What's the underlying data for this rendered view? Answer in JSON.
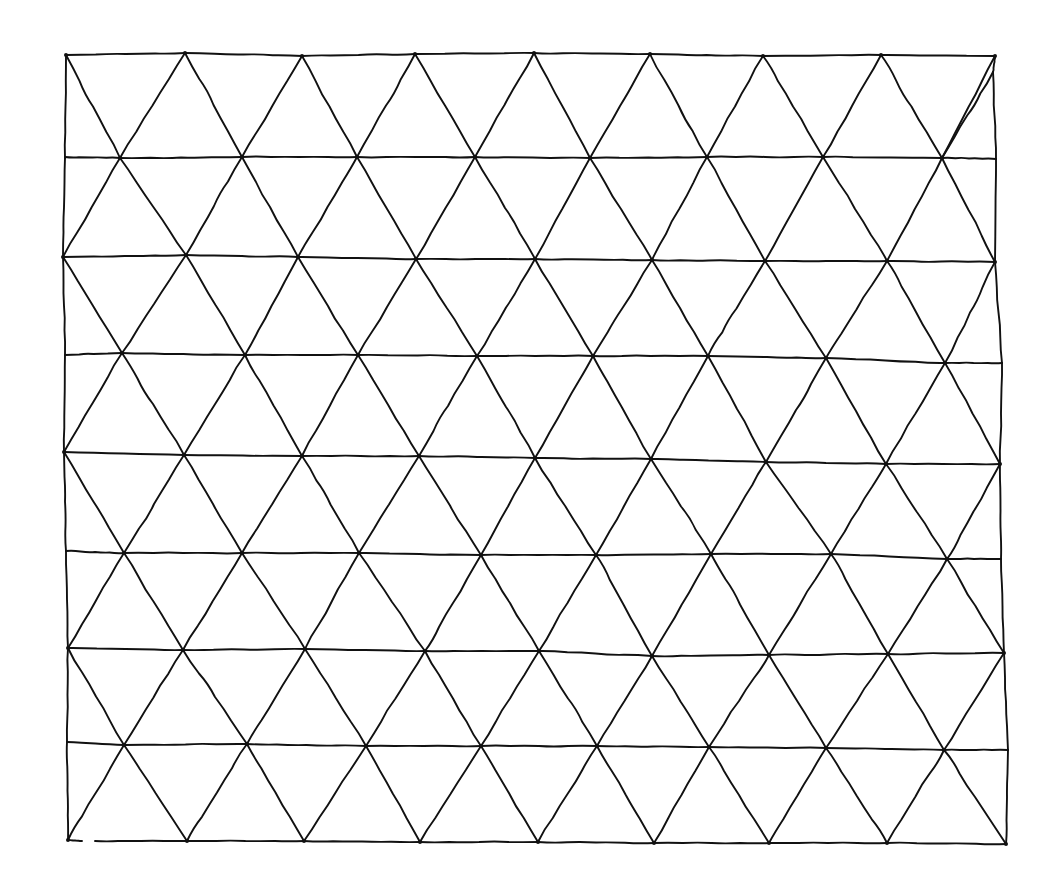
{
  "figure": {
    "stroke_color": "#111111",
    "background_color": "#ffffff"
  },
  "grid": {
    "rows": [
      {
        "y": 55,
        "vertices": [
          [
            66,
            55
          ],
          [
            185,
            53
          ],
          [
            302,
            56
          ],
          [
            415,
            54
          ],
          [
            534,
            53
          ],
          [
            650,
            54
          ],
          [
            763,
            56
          ],
          [
            881,
            55
          ],
          [
            995,
            56
          ]
        ]
      },
      {
        "y": 158,
        "vertices": [
          [
            65,
            157
          ],
          [
            120,
            158
          ],
          [
            242,
            157
          ],
          [
            357,
            157
          ],
          [
            475,
            157
          ],
          [
            590,
            158
          ],
          [
            707,
            157
          ],
          [
            823,
            157
          ],
          [
            942,
            158
          ],
          [
            996,
            159
          ]
        ]
      },
      {
        "y": 256,
        "vertices": [
          [
            63,
            257
          ],
          [
            186,
            255
          ],
          [
            298,
            257
          ],
          [
            416,
            259
          ],
          [
            535,
            259
          ],
          [
            652,
            260
          ],
          [
            765,
            261
          ],
          [
            887,
            261
          ],
          [
            995,
            262
          ]
        ]
      },
      {
        "y": 355,
        "vertices": [
          [
            65,
            355
          ],
          [
            122,
            353
          ],
          [
            245,
            355
          ],
          [
            358,
            355
          ],
          [
            477,
            356
          ],
          [
            593,
            356
          ],
          [
            708,
            356
          ],
          [
            826,
            358
          ],
          [
            945,
            363
          ],
          [
            1002,
            363
          ]
        ]
      },
      {
        "y": 453,
        "vertices": [
          [
            64,
            452
          ],
          [
            184,
            455
          ],
          [
            302,
            456
          ],
          [
            419,
            456
          ],
          [
            535,
            458
          ],
          [
            651,
            459
          ],
          [
            766,
            462
          ],
          [
            886,
            464
          ],
          [
            1000,
            464
          ]
        ]
      },
      {
        "y": 553,
        "vertices": [
          [
            66,
            551
          ],
          [
            124,
            553
          ],
          [
            242,
            553
          ],
          [
            359,
            553
          ],
          [
            481,
            555
          ],
          [
            596,
            555
          ],
          [
            711,
            554
          ],
          [
            831,
            554
          ],
          [
            947,
            559
          ],
          [
            1001,
            559
          ]
        ]
      },
      {
        "y": 650,
        "vertices": [
          [
            68,
            648
          ],
          [
            183,
            650
          ],
          [
            305,
            649
          ],
          [
            425,
            651
          ],
          [
            539,
            651
          ],
          [
            652,
            656
          ],
          [
            769,
            655
          ],
          [
            888,
            654
          ],
          [
            1004,
            653
          ]
        ]
      },
      {
        "y": 746,
        "vertices": [
          [
            67,
            742
          ],
          [
            124,
            745
          ],
          [
            247,
            744
          ],
          [
            366,
            746
          ],
          [
            481,
            746
          ],
          [
            597,
            746
          ],
          [
            709,
            747
          ],
          [
            826,
            748
          ],
          [
            944,
            750
          ],
          [
            1008,
            750
          ]
        ]
      },
      {
        "y": 843,
        "vertices": [
          [
            68,
            840
          ],
          [
            187,
            841
          ],
          [
            304,
            841
          ],
          [
            420,
            842
          ],
          [
            538,
            842
          ],
          [
            654,
            843
          ],
          [
            769,
            843
          ],
          [
            887,
            843
          ],
          [
            1006,
            844
          ]
        ]
      }
    ],
    "border": {
      "left": [
        [
          66,
          55
        ],
        [
          65,
          158
        ],
        [
          63,
          257
        ],
        [
          65,
          355
        ],
        [
          64,
          452
        ],
        [
          66,
          551
        ],
        [
          68,
          648
        ],
        [
          67,
          742
        ],
        [
          68,
          840
        ]
      ],
      "right": [
        [
          995,
          56
        ],
        [
          993,
          72
        ],
        [
          996,
          159
        ],
        [
          995,
          262
        ],
        [
          1002,
          363
        ],
        [
          1000,
          464
        ],
        [
          1001,
          559
        ],
        [
          1004,
          653
        ],
        [
          1008,
          750
        ],
        [
          1006,
          844
        ]
      ]
    },
    "bottom_gap": {
      "x_start": 82,
      "x_end": 95,
      "y": 841
    },
    "right_top_diagonal_start": [
      993,
      72
    ]
  }
}
